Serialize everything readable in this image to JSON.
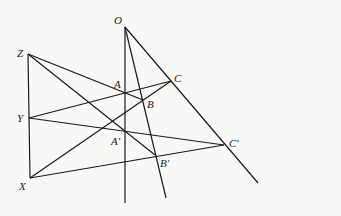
{
  "diagram": {
    "points": {
      "O": {
        "label": "O",
        "x": 125,
        "y": 27
      },
      "A": {
        "label": "A",
        "x": 125,
        "y": 93
      },
      "B": {
        "label": "B",
        "x": 143,
        "y": 100
      },
      "C": {
        "label": "C",
        "x": 171,
        "y": 81
      },
      "A2": {
        "label": "A'",
        "x": 125,
        "y": 132
      },
      "B2": {
        "label": "B'",
        "x": 155,
        "y": 155
      },
      "C2": {
        "label": "C'",
        "x": 224,
        "y": 145
      },
      "X": {
        "label": "X",
        "x": 30,
        "y": 178
      },
      "Y": {
        "label": "Y",
        "x": 29,
        "y": 118
      },
      "Z": {
        "label": "Z",
        "x": 28,
        "y": 54
      }
    },
    "lines": [
      {
        "from": "O",
        "to": "end_OA",
        "desc": "O-A-A' ray"
      },
      {
        "from": "O",
        "to": "end_OB",
        "desc": "O-B-B' ray"
      },
      {
        "from": "O",
        "to": "end_OC",
        "desc": "O-C-C' ray"
      },
      {
        "from": "Z",
        "to": "X",
        "desc": "line XYZ"
      },
      {
        "from": "Z",
        "to": "B"
      },
      {
        "from": "Z",
        "to": "B2"
      },
      {
        "from": "Y",
        "to": "C"
      },
      {
        "from": "Y",
        "to": "C2"
      },
      {
        "from": "X",
        "to": "C"
      },
      {
        "from": "X",
        "to": "C2"
      }
    ]
  }
}
